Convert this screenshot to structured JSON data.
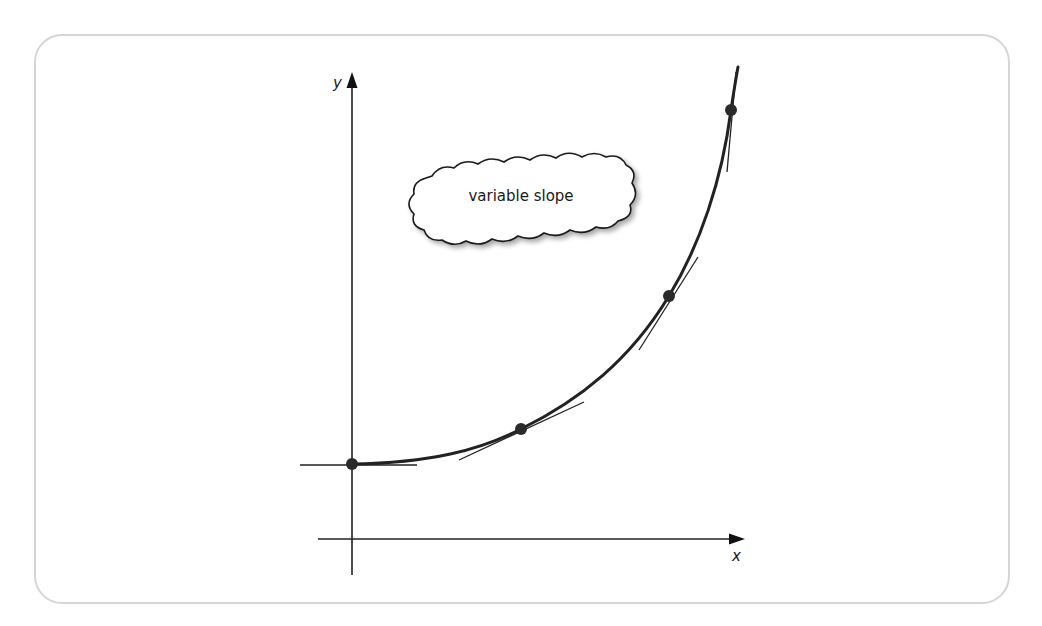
{
  "diagram": {
    "type": "exponential-curve-with-tangents",
    "axes": {
      "x_label": "x",
      "y_label": "y"
    },
    "callout": {
      "text": "variable slope",
      "shape": "cloud"
    },
    "tangent_points": [
      {
        "id": "p1",
        "description": "y-intercept, near-zero slope"
      },
      {
        "id": "p2",
        "description": "moderate slope"
      },
      {
        "id": "p3",
        "description": "steep slope"
      },
      {
        "id": "p4",
        "description": "very steep slope"
      }
    ],
    "colors": {
      "curve": "#222222",
      "axes": "#222222",
      "points": "#2a2a2a",
      "frame_border": "#d6d6d6",
      "background": "#ffffff"
    }
  }
}
